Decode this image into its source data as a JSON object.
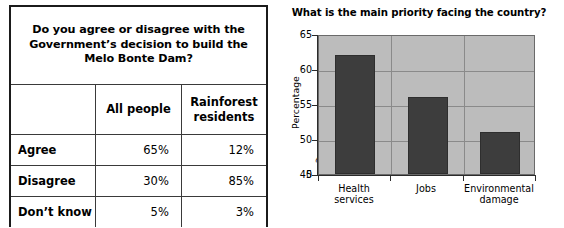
{
  "survey_table": {
    "question": "Do you agree or disagree with the Government’s decision to build the Melo Bonte Dam?",
    "corner_label": "",
    "columns": [
      "All people",
      "Rainforest residents"
    ],
    "rows": [
      {
        "label": "Agree",
        "all_people": "65%",
        "rainforest_residents": "12%"
      },
      {
        "label": "Disagree",
        "all_people": "30%",
        "rainforest_residents": "85%"
      },
      {
        "label": "Don’t know",
        "all_people": "5%",
        "rainforest_residents": "3%"
      }
    ]
  },
  "chart_data": {
    "type": "bar",
    "title": "What is the main priority facing the country?",
    "xlabel": "",
    "ylabel": "Percentage",
    "categories": [
      "Health services",
      "Jobs",
      "Environmental damage"
    ],
    "values": [
      62,
      56,
      51
    ],
    "ytick_labels": [
      "0",
      "45",
      "50",
      "55",
      "60",
      "65"
    ],
    "ylim": [
      45,
      65
    ],
    "axis_break": true,
    "axis_break_glyph": "≈",
    "grid": true,
    "legend": "none",
    "colors": {
      "bar": "#3d3d3d",
      "plot_background": "#bcbcbc",
      "gridline": "#8a8a8a",
      "axis": "#2b2b2b"
    }
  }
}
